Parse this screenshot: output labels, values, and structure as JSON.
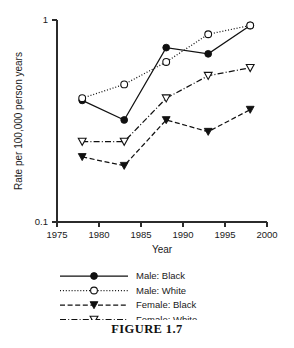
{
  "figure": {
    "caption": "FIGURE 1.7"
  },
  "chart_data": {
    "type": "line",
    "title": "",
    "xlabel": "Year",
    "ylabel": "Rate per 100,000 person years",
    "yscale": "log",
    "ylim": [
      0.1,
      1
    ],
    "ytick_labels": [
      "1",
      "0.1"
    ],
    "ytick_values": [
      1,
      0.1
    ],
    "xlim": [
      1975,
      2000
    ],
    "xtick_labels": [
      "1975",
      "1980",
      "1985",
      "1990",
      "1995",
      "2000"
    ],
    "xtick_values": [
      1975,
      1980,
      1985,
      1990,
      1995,
      2000
    ],
    "grid": false,
    "legend_position": "below",
    "x": [
      1978,
      1983,
      1988,
      1993,
      1998
    ],
    "series": [
      {
        "name": "Male: Black",
        "values": [
          0.4,
          0.32,
          0.73,
          0.68,
          0.94
        ],
        "line_style": "solid",
        "marker": "filled-circle",
        "color": "#111111"
      },
      {
        "name": "Male: White",
        "values": [
          0.41,
          0.48,
          0.62,
          0.85,
          0.94
        ],
        "line_style": "dotted",
        "marker": "open-circle",
        "color": "#111111"
      },
      {
        "name": "Female: Black",
        "values": [
          0.21,
          0.19,
          0.32,
          0.28,
          0.36
        ],
        "line_style": "dashed",
        "marker": "filled-triangle-down",
        "color": "#111111"
      },
      {
        "name": "Female: White",
        "values": [
          0.25,
          0.25,
          0.41,
          0.53,
          0.58
        ],
        "line_style": "dash-dot",
        "marker": "open-triangle-down",
        "color": "#111111"
      }
    ]
  }
}
